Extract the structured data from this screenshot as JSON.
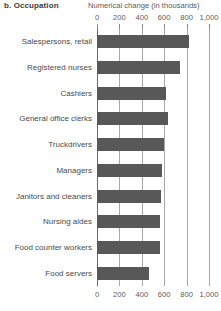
{
  "panel": {
    "label": "b. Occupation"
  },
  "chart_data": {
    "type": "bar",
    "orientation": "horizontal",
    "title": "b. Occupation",
    "xlabel": "Numerical change (in thousands)",
    "ylabel": "",
    "xlim": [
      0,
      1000
    ],
    "xticks": [
      0,
      200,
      400,
      600,
      800,
      1000
    ],
    "xticklabels": [
      "0",
      "200",
      "400",
      "600",
      "800",
      "1,000"
    ],
    "grid": true,
    "grid_axis": "x",
    "legend": false,
    "axis_title_positions": [
      "top",
      "bottom"
    ],
    "bar_color": "#585858",
    "categories": [
      "Salespersons, retail",
      "Registered nurses",
      "Cashiers",
      "General office clerks",
      "Truckdrivers",
      "Managers",
      "Janitors and cleaners",
      "Nursing aides",
      "Food counter workers",
      "Food servers"
    ],
    "values": [
      820,
      740,
      620,
      635,
      600,
      580,
      570,
      560,
      565,
      465
    ]
  }
}
